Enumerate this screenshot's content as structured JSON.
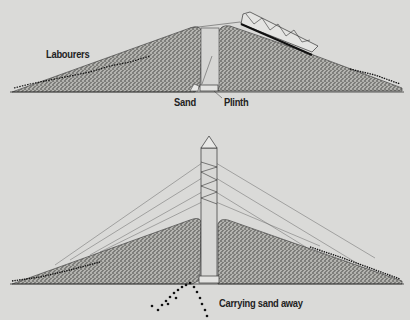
{
  "figure": {
    "type": "illustration",
    "background": "#dadad8",
    "mound_color": "#8a8a86",
    "panels": [
      {
        "id": "top",
        "labels": {
          "labourers": "Labourers",
          "sand": "Sand",
          "plinth": "Plinth"
        }
      },
      {
        "id": "bottom",
        "labels": {
          "carrying": "Carrying sand away"
        }
      }
    ]
  }
}
